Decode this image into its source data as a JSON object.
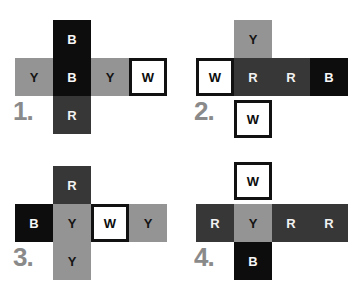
{
  "sheet": {
    "title": "Cube net multiple choice options",
    "background_color": "#ffffff"
  },
  "palette": {
    "Y": "#949494",
    "R": "#373737",
    "B": "#0d0d0d",
    "W": "#ffffff",
    "W_border": "#111111",
    "label_color": "#8a8a8a"
  },
  "legend": {
    "Y": "Y",
    "R": "R",
    "B": "B",
    "W": "W"
  },
  "nets": [
    {
      "label": "1.",
      "top": "B",
      "row": [
        "Y",
        "B",
        "Y",
        "W"
      ],
      "bottom": "R"
    },
    {
      "label": "2.",
      "top": "Y",
      "row": [
        "W",
        "R",
        "R",
        "B"
      ],
      "bottom": "W"
    },
    {
      "label": "3.",
      "top": "R",
      "row": [
        "B",
        "Y",
        "W",
        "Y"
      ],
      "bottom": "Y"
    },
    {
      "label": "4.",
      "top": "W",
      "row": [
        "R",
        "Y",
        "R",
        "R"
      ],
      "bottom": "B"
    }
  ]
}
